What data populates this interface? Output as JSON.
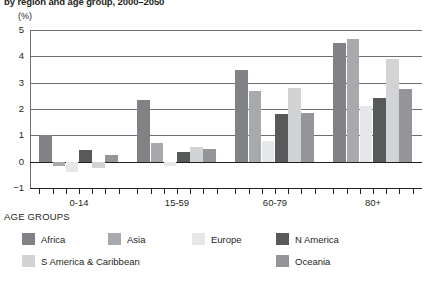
{
  "title": "by region and age group, 2000–2050",
  "unit_label": "(%)",
  "axis_caption": "AGE GROUPS",
  "colors": {
    "africa": "#808285",
    "asia": "#a7a9ac",
    "europe": "#e6e7e8",
    "n_america": "#58595b",
    "s_america": "#d1d3d4",
    "oceania": "#939598",
    "gridline": "#6d6e71",
    "axis": "#231f20",
    "background": "#ffffff"
  },
  "chart_data": {
    "type": "bar",
    "title": "by region and age group, 2000–2050",
    "xlabel": "AGE GROUPS",
    "ylabel": "(%)",
    "ylim": [
      -1,
      5
    ],
    "yticks": [
      -1,
      0,
      1,
      2,
      3,
      4,
      5
    ],
    "ytick_labels": [
      "−1",
      "0",
      "1",
      "2",
      "3",
      "4",
      "5"
    ],
    "grid": true,
    "legend_position": "bottom",
    "categories": [
      "0-14",
      "15-59",
      "60-79",
      "80+"
    ],
    "series": [
      {
        "name": "Africa",
        "key": "africa",
        "values": [
          1.0,
          2.35,
          3.5,
          4.5
        ]
      },
      {
        "name": "Asia",
        "key": "asia",
        "values": [
          -0.15,
          0.7,
          2.7,
          4.65
        ]
      },
      {
        "name": "Europe",
        "key": "europe",
        "values": [
          -0.4,
          -0.15,
          0.8,
          2.1
        ]
      },
      {
        "name": "N America",
        "key": "n_america",
        "values": [
          0.45,
          0.35,
          1.8,
          2.4
        ]
      },
      {
        "name": "S America & Caribbean",
        "key": "s_america",
        "values": [
          -0.25,
          0.55,
          2.8,
          3.9
        ]
      },
      {
        "name": "Oceania",
        "key": "oceania",
        "values": [
          0.25,
          0.5,
          1.85,
          2.75
        ]
      }
    ]
  },
  "legend": [
    {
      "name": "Africa",
      "key": "africa"
    },
    {
      "name": "Asia",
      "key": "asia"
    },
    {
      "name": "Europe",
      "key": "europe"
    },
    {
      "name": "N America",
      "key": "n_america"
    },
    {
      "name": "S America & Caribbean",
      "key": "s_america"
    },
    {
      "name": "Oceania",
      "key": "oceania"
    }
  ]
}
